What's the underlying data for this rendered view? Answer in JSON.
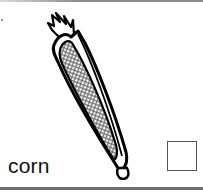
{
  "card": {
    "label": "corn",
    "illustration": "corn-cob-icon",
    "checkbox_checked": false
  }
}
